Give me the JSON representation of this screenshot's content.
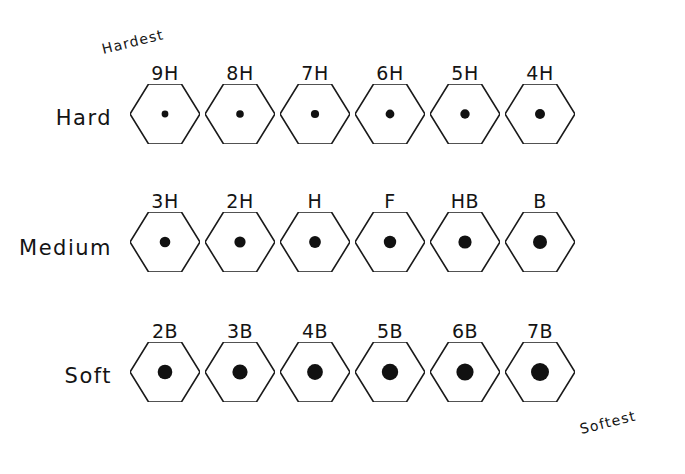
{
  "figure": {
    "background_color": "#ffffff",
    "ink_color": "#141414",
    "hex_stroke_color": "#1a1a1a",
    "core_color": "#111111"
  },
  "scale_notes": [
    {
      "text": "Hardest",
      "x": 104,
      "y": 57,
      "rotate": -14
    },
    {
      "text": "Softest",
      "x": 582,
      "y": 437,
      "rotate": -14
    }
  ],
  "rows": [
    {
      "label": "Hard",
      "label_x": 112,
      "label_y": 118,
      "center_y": 114,
      "pencils": [
        {
          "grade": "9H",
          "cx": 165,
          "core": 3.4
        },
        {
          "grade": "8H",
          "cx": 240,
          "core": 3.8
        },
        {
          "grade": "7H",
          "cx": 315,
          "core": 4.1
        },
        {
          "grade": "6H",
          "cx": 390,
          "core": 4.4
        },
        {
          "grade": "5H",
          "cx": 465,
          "core": 4.7
        },
        {
          "grade": "4H",
          "cx": 540,
          "core": 5.0
        }
      ]
    },
    {
      "label": "Medium",
      "label_x": 112,
      "label_y": 248,
      "center_y": 242,
      "pencils": [
        {
          "grade": "3H",
          "cx": 165,
          "core": 5.3
        },
        {
          "grade": "2H",
          "cx": 240,
          "core": 5.6
        },
        {
          "grade": "H",
          "cx": 315,
          "core": 5.9
        },
        {
          "grade": "F",
          "cx": 390,
          "core": 6.2
        },
        {
          "grade": "HB",
          "cx": 465,
          "core": 6.6
        },
        {
          "grade": "B",
          "cx": 540,
          "core": 7.0
        }
      ]
    },
    {
      "label": "Soft",
      "label_x": 112,
      "label_y": 376,
      "center_y": 372,
      "pencils": [
        {
          "grade": "2B",
          "cx": 165,
          "core": 7.3
        },
        {
          "grade": "3B",
          "cx": 240,
          "core": 7.6
        },
        {
          "grade": "4B",
          "cx": 315,
          "core": 7.9
        },
        {
          "grade": "5B",
          "cx": 390,
          "core": 8.2
        },
        {
          "grade": "6B",
          "cx": 465,
          "core": 8.6
        },
        {
          "grade": "7B",
          "cx": 540,
          "core": 9.0
        }
      ]
    }
  ],
  "hexagon": {
    "width": 70,
    "height": 60,
    "stroke_width": 1.6
  }
}
